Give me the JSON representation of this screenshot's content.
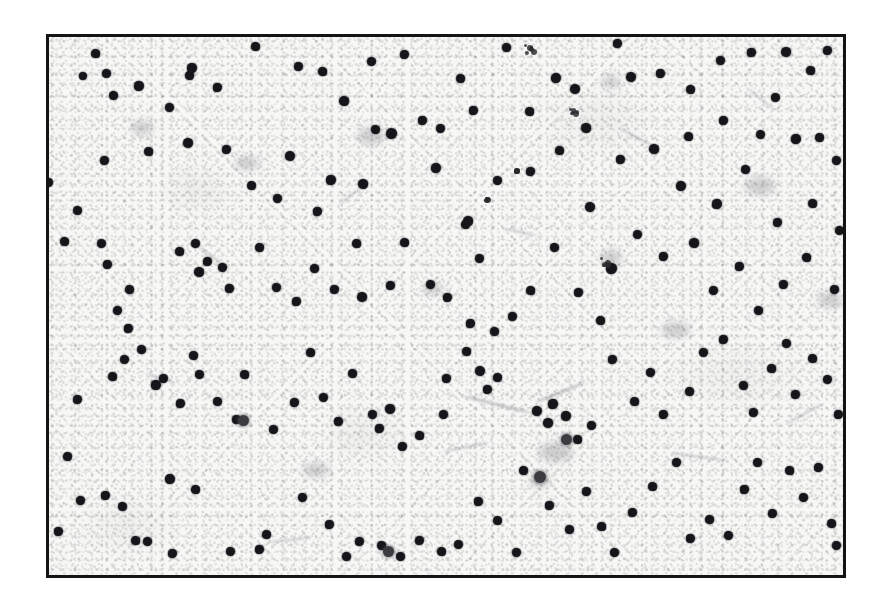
{
  "figure": {
    "domain_type": "micrograph",
    "canvas": {
      "width": 880,
      "height": 606
    },
    "outer_background": "#ffffff",
    "frame": {
      "name": "micrograph-border",
      "left": 46,
      "top": 34,
      "width": 800,
      "height": 544,
      "border_width": 3,
      "border_color": "#141414"
    },
    "field": {
      "background_color": "#f7f7f6",
      "texture": "fine grain / speckled substrate",
      "particle_color": "#16161a",
      "particle_count": 182,
      "typical_particle_diameter_px": 10
    },
    "caption": "",
    "labels": [],
    "scalebar": null
  },
  "particles": [
    [
      95,
      53,
      9
    ],
    [
      106,
      73,
      9
    ],
    [
      192,
      68,
      10
    ],
    [
      255,
      46,
      9
    ],
    [
      83,
      76,
      8
    ],
    [
      139,
      86,
      10
    ],
    [
      189,
      75,
      9
    ],
    [
      169,
      107,
      9
    ],
    [
      217,
      87,
      9
    ],
    [
      113,
      95,
      9
    ],
    [
      298,
      66,
      9
    ],
    [
      322,
      71,
      9
    ],
    [
      371,
      61,
      9
    ],
    [
      404,
      54,
      9
    ],
    [
      344,
      101,
      10
    ],
    [
      391,
      133,
      11
    ],
    [
      422,
      120,
      9
    ],
    [
      460,
      78,
      9
    ],
    [
      440,
      128,
      9
    ],
    [
      473,
      110,
      9
    ],
    [
      506,
      47,
      9
    ],
    [
      556,
      78,
      10
    ],
    [
      529,
      111,
      9
    ],
    [
      575,
      89,
      10
    ],
    [
      617,
      43,
      9
    ],
    [
      586,
      128,
      10
    ],
    [
      631,
      77,
      10
    ],
    [
      660,
      73,
      9
    ],
    [
      690,
      89,
      9
    ],
    [
      720,
      60,
      9
    ],
    [
      751,
      52,
      9
    ],
    [
      786,
      52,
      10
    ],
    [
      827,
      50,
      9
    ],
    [
      810,
      70,
      9
    ],
    [
      775,
      97,
      9
    ],
    [
      723,
      120,
      9
    ],
    [
      688,
      136,
      9
    ],
    [
      760,
      134,
      9
    ],
    [
      796,
      139,
      10
    ],
    [
      819,
      137,
      9
    ],
    [
      836,
      160,
      9
    ],
    [
      48,
      182,
      9
    ],
    [
      77,
      210,
      9
    ],
    [
      104,
      160,
      9
    ],
    [
      148,
      151,
      9
    ],
    [
      188,
      143,
      10
    ],
    [
      226,
      149,
      9
    ],
    [
      251,
      185,
      9
    ],
    [
      290,
      156,
      10
    ],
    [
      331,
      180,
      10
    ],
    [
      363,
      184,
      10
    ],
    [
      277,
      198,
      9
    ],
    [
      317,
      211,
      9
    ],
    [
      375,
      129,
      9
    ],
    [
      436,
      168,
      10
    ],
    [
      468,
      221,
      10
    ],
    [
      497,
      180,
      9
    ],
    [
      530,
      171,
      9
    ],
    [
      559,
      150,
      9
    ],
    [
      590,
      207,
      10
    ],
    [
      620,
      159,
      9
    ],
    [
      654,
      149,
      10
    ],
    [
      681,
      186,
      10
    ],
    [
      717,
      204,
      10
    ],
    [
      745,
      169,
      9
    ],
    [
      777,
      222,
      9
    ],
    [
      812,
      203,
      9
    ],
    [
      839,
      230,
      9
    ],
    [
      611,
      268,
      11
    ],
    [
      64,
      241,
      9
    ],
    [
      101,
      243,
      9
    ],
    [
      107,
      264,
      9
    ],
    [
      129,
      289,
      9
    ],
    [
      117,
      310,
      9
    ],
    [
      128,
      328,
      9
    ],
    [
      141,
      349,
      9
    ],
    [
      163,
      378,
      9
    ],
    [
      179,
      251,
      9
    ],
    [
      195,
      243,
      9
    ],
    [
      207,
      261,
      9
    ],
    [
      199,
      272,
      10
    ],
    [
      222,
      267,
      9
    ],
    [
      229,
      288,
      9
    ],
    [
      259,
      247,
      9
    ],
    [
      276,
      287,
      9
    ],
    [
      296,
      301,
      9
    ],
    [
      314,
      268,
      9
    ],
    [
      334,
      289,
      9
    ],
    [
      356,
      243,
      9
    ],
    [
      362,
      297,
      10
    ],
    [
      390,
      285,
      9
    ],
    [
      404,
      242,
      9
    ],
    [
      430,
      284,
      9
    ],
    [
      447,
      297,
      9
    ],
    [
      465,
      224,
      9
    ],
    [
      479,
      258,
      9
    ],
    [
      470,
      323,
      9
    ],
    [
      494,
      331,
      9
    ],
    [
      512,
      316,
      9
    ],
    [
      530,
      290,
      9
    ],
    [
      554,
      247,
      9
    ],
    [
      578,
      292,
      9
    ],
    [
      600,
      320,
      9
    ],
    [
      637,
      234,
      9
    ],
    [
      663,
      256,
      9
    ],
    [
      694,
      243,
      10
    ],
    [
      713,
      290,
      9
    ],
    [
      739,
      266,
      9
    ],
    [
      758,
      310,
      9
    ],
    [
      783,
      284,
      9
    ],
    [
      806,
      257,
      9
    ],
    [
      834,
      289,
      9
    ],
    [
      77,
      399,
      9
    ],
    [
      112,
      376,
      9
    ],
    [
      124,
      359,
      9
    ],
    [
      156,
      385,
      10
    ],
    [
      193,
      355,
      9
    ],
    [
      199,
      374,
      9
    ],
    [
      180,
      403,
      9
    ],
    [
      217,
      401,
      9
    ],
    [
      236,
      419,
      9
    ],
    [
      244,
      374,
      9
    ],
    [
      273,
      429,
      9
    ],
    [
      294,
      402,
      9
    ],
    [
      310,
      352,
      9
    ],
    [
      323,
      397,
      9
    ],
    [
      338,
      421,
      9
    ],
    [
      352,
      373,
      9
    ],
    [
      372,
      414,
      9
    ],
    [
      379,
      428,
      9
    ],
    [
      390,
      409,
      10
    ],
    [
      402,
      446,
      9
    ],
    [
      419,
      435,
      9
    ],
    [
      443,
      414,
      9
    ],
    [
      446,
      378,
      9
    ],
    [
      466,
      351,
      9
    ],
    [
      480,
      371,
      10
    ],
    [
      487,
      389,
      9
    ],
    [
      497,
      377,
      9
    ],
    [
      537,
      411,
      10
    ],
    [
      553,
      404,
      10
    ],
    [
      548,
      423,
      10
    ],
    [
      566,
      416,
      10
    ],
    [
      577,
      439,
      9
    ],
    [
      591,
      425,
      9
    ],
    [
      612,
      359,
      9
    ],
    [
      634,
      401,
      9
    ],
    [
      650,
      372,
      9
    ],
    [
      663,
      414,
      9
    ],
    [
      689,
      391,
      9
    ],
    [
      703,
      352,
      9
    ],
    [
      723,
      339,
      9
    ],
    [
      743,
      385,
      9
    ],
    [
      753,
      412,
      9
    ],
    [
      771,
      368,
      9
    ],
    [
      786,
      343,
      9
    ],
    [
      795,
      394,
      9
    ],
    [
      812,
      358,
      9
    ],
    [
      827,
      379,
      9
    ],
    [
      838,
      414,
      9
    ],
    [
      67,
      456,
      9
    ],
    [
      80,
      500,
      9
    ],
    [
      105,
      495,
      9
    ],
    [
      122,
      506,
      9
    ],
    [
      170,
      479,
      10
    ],
    [
      135,
      540,
      9
    ],
    [
      147,
      541,
      9
    ],
    [
      172,
      553,
      9
    ],
    [
      195,
      489,
      9
    ],
    [
      230,
      551,
      9
    ],
    [
      259,
      549,
      9
    ],
    [
      266,
      534,
      9
    ],
    [
      302,
      497,
      9
    ],
    [
      329,
      524,
      9
    ],
    [
      346,
      556,
      9
    ],
    [
      359,
      541,
      9
    ],
    [
      381,
      545,
      9
    ],
    [
      400,
      556,
      9
    ],
    [
      419,
      540,
      9
    ],
    [
      441,
      551,
      9
    ],
    [
      458,
      544,
      9
    ],
    [
      478,
      501,
      9
    ],
    [
      497,
      520,
      9
    ],
    [
      516,
      552,
      9
    ],
    [
      549,
      505,
      9
    ],
    [
      569,
      529,
      9
    ],
    [
      586,
      491,
      9
    ],
    [
      601,
      526,
      9
    ],
    [
      614,
      552,
      9
    ],
    [
      632,
      512,
      9
    ],
    [
      652,
      486,
      9
    ],
    [
      676,
      462,
      9
    ],
    [
      690,
      538,
      9
    ],
    [
      709,
      519,
      9
    ],
    [
      728,
      535,
      9
    ],
    [
      744,
      489,
      9
    ],
    [
      757,
      462,
      9
    ],
    [
      772,
      513,
      9
    ],
    [
      789,
      470,
      9
    ],
    [
      803,
      497,
      9
    ],
    [
      818,
      467,
      9
    ],
    [
      831,
      523,
      9
    ],
    [
      836,
      545,
      9
    ],
    [
      58,
      531,
      9
    ],
    [
      523,
      470,
      9
    ]
  ],
  "soft_particles": [
    [
      540,
      477,
      12
    ],
    [
      388,
      551,
      11
    ],
    [
      566,
      439,
      11
    ],
    [
      243,
      420,
      11
    ]
  ],
  "aggregates": [
    [
      531,
      50,
      14,
      12
    ],
    [
      574,
      112,
      12,
      11
    ],
    [
      488,
      200,
      8,
      8
    ],
    [
      517,
      171,
      7,
      7
    ],
    [
      606,
      263,
      13,
      12
    ]
  ],
  "smudges": [
    [
      371,
      136,
      26,
      18
    ],
    [
      556,
      452,
      34,
      20
    ],
    [
      611,
      258,
      22,
      16
    ],
    [
      540,
      480,
      20,
      16
    ],
    [
      760,
      186,
      30,
      18
    ],
    [
      247,
      163,
      24,
      14
    ],
    [
      676,
      330,
      28,
      16
    ],
    [
      433,
      289,
      20,
      12
    ],
    [
      142,
      128,
      22,
      14
    ],
    [
      830,
      300,
      24,
      16
    ],
    [
      316,
      470,
      26,
      14
    ],
    [
      611,
      82,
      20,
      12
    ]
  ],
  "streaks": [
    [
      497,
      404,
      70,
      3,
      14
    ],
    [
      560,
      392,
      54,
      3,
      -22
    ],
    [
      214,
      258,
      40,
      2,
      35
    ],
    [
      700,
      457,
      58,
      2,
      8
    ],
    [
      466,
      447,
      46,
      2,
      -12
    ],
    [
      636,
      137,
      36,
      2,
      28
    ],
    [
      289,
      540,
      44,
      2,
      -6
    ],
    [
      761,
      99,
      32,
      2,
      40
    ],
    [
      160,
      378,
      30,
      2,
      18
    ],
    [
      804,
      414,
      40,
      2,
      -30
    ],
    [
      520,
      232,
      34,
      2,
      12
    ],
    [
      350,
      196,
      28,
      2,
      -38
    ]
  ]
}
